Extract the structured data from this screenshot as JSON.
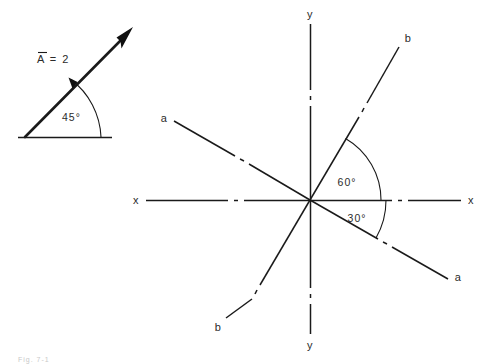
{
  "figure": {
    "background_color": "#ffffff",
    "ink_color": "#1a1a1a",
    "width": 490,
    "height": 364,
    "caption_fragment": "Fig.  7-1"
  },
  "vector_diagram": {
    "name": "vector-at-45-degrees",
    "vector_label": "A  =  2",
    "vector_label_overbar": true,
    "angle_label": "45°",
    "angle_value": 45,
    "angle_unit": "degrees",
    "baseline_label": "",
    "origin": {
      "x": 25,
      "y": 137
    },
    "tip": {
      "x": 133,
      "y": 28
    },
    "baseline_end": {
      "x": 112,
      "y": 137
    },
    "has_arrowhead": true,
    "has_arc_arrowhead": true
  },
  "axes_diagram": {
    "name": "rotated-axes-60-30",
    "origin": {
      "x": 310,
      "y": 200
    },
    "angle_labels": [
      {
        "text": "60°",
        "value": 60,
        "between": "x-axis-and-b-axis",
        "position": "above-x-axis"
      },
      {
        "text": "30°",
        "value": 30,
        "between": "x-axis-and-a-axis",
        "position": "below-x-axis"
      }
    ],
    "axes": [
      {
        "id": "x-axis",
        "style": "dash-dot",
        "angle_deg": 0,
        "labels": [
          {
            "text": "x",
            "end": "negative",
            "x": 136,
            "y": 200
          },
          {
            "text": "x",
            "end": "positive",
            "x": 471,
            "y": 200
          }
        ]
      },
      {
        "id": "y-axis",
        "style": "dash-dot",
        "angle_deg": 90,
        "labels": [
          {
            "text": "y",
            "end": "positive",
            "x": 310,
            "y": 14
          },
          {
            "text": "y",
            "end": "negative",
            "x": 310,
            "y": 345
          }
        ]
      },
      {
        "id": "a-axis",
        "style": "dash-dot",
        "angle_deg": -30,
        "labels": [
          {
            "text": "a",
            "end": "negative",
            "x": 164,
            "y": 118
          },
          {
            "text": "a",
            "end": "positive",
            "x": 458,
            "y": 277
          }
        ]
      },
      {
        "id": "b-axis",
        "style": "dash-dot",
        "angle_deg": 60,
        "labels": [
          {
            "text": "b",
            "end": "positive",
            "x": 408,
            "y": 38
          },
          {
            "text": "b",
            "end": "negative",
            "x": 218,
            "y": 327
          }
        ]
      }
    ]
  }
}
